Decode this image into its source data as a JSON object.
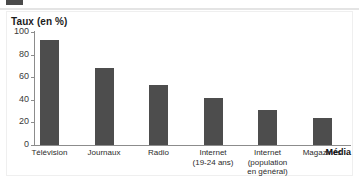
{
  "chart_data": {
    "type": "bar",
    "title": "Taux (en %)",
    "xlabel": "Média",
    "ylabel": "",
    "ylim": [
      0,
      100
    ],
    "yticks": [
      0,
      20,
      40,
      60,
      80,
      100
    ],
    "ytick_labels": [
      "0",
      "20",
      "40",
      "60",
      "80",
      "100"
    ],
    "grid": false,
    "legend": false,
    "categories": [
      "Télévision",
      "Journaux",
      "Radio",
      "Internet\n(19-24 ans)",
      "Internet\n(population\nen général)",
      "Magazines"
    ],
    "values": [
      93,
      68,
      53,
      42,
      31,
      24
    ],
    "bar_color": "#4d4d4d"
  },
  "axis": {
    "baseline_px": 145,
    "top_px": 32,
    "axis_color": "#8c8c8c"
  }
}
